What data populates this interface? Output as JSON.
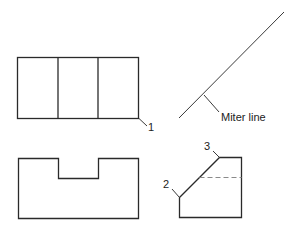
{
  "diagram": {
    "type": "orthographic-projection",
    "views": {
      "top_view": {
        "name": "Top view",
        "dividers": 2
      },
      "front_view": {
        "name": "Front view",
        "has_notch": true
      },
      "side_view": {
        "name": "Side view",
        "has_hidden_line": true
      }
    },
    "miter_line": {
      "label": "Miter line"
    },
    "callouts": [
      {
        "id": "1",
        "label": "1"
      },
      {
        "id": "2",
        "label": "2"
      },
      {
        "id": "3",
        "label": "3"
      }
    ],
    "colors": {
      "line": "#2a2a2a",
      "hidden_line": "#8a8a8a",
      "background": "#ffffff"
    }
  }
}
